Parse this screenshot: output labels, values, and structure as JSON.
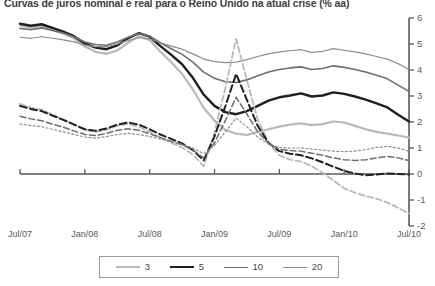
{
  "chart_data": {
    "type": "line",
    "title": "Curvas de juros nominal e real para o Reino Unido na atual crise (% aa)",
    "xlabel": "",
    "ylabel": "",
    "ylim": [
      -2,
      6
    ],
    "yticks": [
      -2,
      -1,
      0,
      1,
      2,
      3,
      4,
      5,
      6
    ],
    "ytick_labels": [
      "-2",
      "-1",
      "0",
      "1",
      "2",
      "3",
      "4",
      "5",
      "6"
    ],
    "y_axis_position": "right",
    "grid": false,
    "legend_position": "bottom",
    "legend_entries": [
      "3",
      "5",
      "10",
      "20"
    ],
    "xtick_labels": [
      "Jul/07",
      "Jan/08",
      "Jul/08",
      "Jan/09",
      "Jul/09",
      "Jan/10",
      "Jul/10"
    ],
    "x_start": "Jul/07",
    "x_end": "Jul/10",
    "n_points": 37,
    "colors": {
      "maturity_3": "#b9b9b9",
      "maturity_5": "#1f1f1f",
      "maturity_10": "#6e6e6e",
      "maturity_20": "#8d8d8d"
    },
    "series": [
      {
        "name": "3",
        "maturity": 3,
        "kind": "nominal",
        "style": "solid",
        "color": "#b9b9b9",
        "width": 2.2,
        "values": [
          5.72,
          5.62,
          5.7,
          5.55,
          5.4,
          5.22,
          4.9,
          4.7,
          4.62,
          4.75,
          5.05,
          5.3,
          5.15,
          4.7,
          4.3,
          3.85,
          3.25,
          2.55,
          2.05,
          1.7,
          1.55,
          1.5,
          1.62,
          1.72,
          1.82,
          1.9,
          1.95,
          1.88,
          1.92,
          2.02,
          1.98,
          1.85,
          1.72,
          1.62,
          1.55,
          1.48,
          1.4
        ]
      },
      {
        "name": "5",
        "maturity": 5,
        "kind": "nominal",
        "style": "solid",
        "color": "#1f1f1f",
        "width": 2.4,
        "values": [
          5.78,
          5.7,
          5.76,
          5.62,
          5.48,
          5.3,
          5.02,
          4.86,
          4.8,
          4.95,
          5.22,
          5.42,
          5.28,
          4.92,
          4.58,
          4.22,
          3.7,
          3.05,
          2.62,
          2.38,
          2.3,
          2.42,
          2.62,
          2.82,
          2.95,
          3.02,
          3.1,
          2.98,
          3.02,
          3.14,
          3.08,
          2.98,
          2.86,
          2.72,
          2.56,
          2.28,
          2.02
        ]
      },
      {
        "name": "10",
        "maturity": 10,
        "kind": "nominal",
        "style": "solid",
        "color": "#6e6e6e",
        "width": 1.6,
        "values": [
          5.6,
          5.55,
          5.62,
          5.52,
          5.42,
          5.28,
          5.08,
          4.98,
          4.95,
          5.08,
          5.26,
          5.4,
          5.3,
          5.05,
          4.82,
          4.6,
          4.3,
          3.92,
          3.68,
          3.55,
          3.52,
          3.62,
          3.78,
          3.92,
          4.02,
          4.08,
          4.12,
          4.02,
          4.06,
          4.16,
          4.1,
          4.02,
          3.92,
          3.8,
          3.66,
          3.42,
          3.18
        ]
      },
      {
        "name": "20",
        "maturity": 20,
        "kind": "nominal",
        "style": "solid",
        "color": "#8d8d8d",
        "width": 1.2,
        "values": [
          5.26,
          5.22,
          5.28,
          5.22,
          5.16,
          5.08,
          4.96,
          4.9,
          4.9,
          5.0,
          5.14,
          5.24,
          5.2,
          5.05,
          4.92,
          4.8,
          4.62,
          4.42,
          4.32,
          4.28,
          4.3,
          4.4,
          4.52,
          4.62,
          4.7,
          4.74,
          4.78,
          4.68,
          4.72,
          4.82,
          4.76,
          4.7,
          4.62,
          4.52,
          4.42,
          4.24,
          4.02
        ]
      },
      {
        "name": "3-real",
        "maturity": 3,
        "kind": "real",
        "style": "dashed",
        "color": "#b9b9b9",
        "width": 1.8,
        "values": [
          2.7,
          2.55,
          2.48,
          2.28,
          2.1,
          1.92,
          1.7,
          1.62,
          1.7,
          1.85,
          1.92,
          1.82,
          1.62,
          1.4,
          1.2,
          1.02,
          0.75,
          0.3,
          1.6,
          3.3,
          5.2,
          3.6,
          2.1,
          1.2,
          0.72,
          0.55,
          0.48,
          0.3,
          0.05,
          -0.25,
          -0.55,
          -0.72,
          -0.85,
          -0.95,
          -1.1,
          -1.3,
          -1.52
        ]
      },
      {
        "name": "5-real",
        "maturity": 5,
        "kind": "real",
        "style": "dashed",
        "color": "#1f1f1f",
        "width": 2.0,
        "values": [
          2.62,
          2.5,
          2.42,
          2.25,
          2.08,
          1.9,
          1.72,
          1.66,
          1.75,
          1.9,
          1.98,
          1.9,
          1.72,
          1.52,
          1.35,
          1.18,
          0.92,
          0.52,
          1.45,
          2.6,
          3.85,
          2.85,
          1.85,
          1.2,
          0.88,
          0.78,
          0.72,
          0.6,
          0.45,
          0.28,
          0.12,
          0.02,
          -0.05,
          -0.02,
          0.02,
          0.0,
          -0.02
        ]
      },
      {
        "name": "10-real",
        "maturity": 10,
        "kind": "real",
        "style": "dashed",
        "color": "#6e6e6e",
        "width": 1.5,
        "values": [
          2.22,
          2.12,
          2.05,
          1.92,
          1.8,
          1.66,
          1.52,
          1.48,
          1.56,
          1.68,
          1.74,
          1.68,
          1.55,
          1.4,
          1.26,
          1.12,
          0.92,
          0.62,
          1.2,
          2.05,
          2.95,
          2.3,
          1.62,
          1.18,
          0.95,
          0.9,
          0.88,
          0.8,
          0.72,
          0.62,
          0.55,
          0.52,
          0.55,
          0.62,
          0.68,
          0.62,
          0.52
        ]
      },
      {
        "name": "20-real",
        "maturity": 20,
        "kind": "real",
        "style": "dotted",
        "color": "#8d8d8d",
        "width": 1.2,
        "values": [
          1.92,
          1.86,
          1.82,
          1.72,
          1.62,
          1.52,
          1.42,
          1.38,
          1.44,
          1.52,
          1.56,
          1.52,
          1.44,
          1.34,
          1.24,
          1.14,
          1.0,
          0.78,
          1.1,
          1.62,
          2.15,
          1.82,
          1.42,
          1.15,
          1.02,
          1.0,
          1.0,
          0.96,
          0.92,
          0.88,
          0.86,
          0.88,
          0.94,
          1.02,
          1.06,
          1.0,
          0.88
        ]
      }
    ]
  }
}
